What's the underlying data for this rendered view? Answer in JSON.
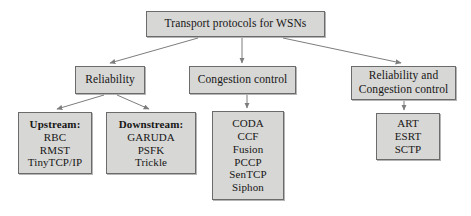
{
  "diagram": {
    "title": "Transport protocols for WSNs",
    "type": "hierarchy-tree",
    "nodes": {
      "root": {
        "id": "root",
        "lines": [
          "Transport protocols for WSNs"
        ]
      },
      "reliability": {
        "id": "reliability",
        "lines": [
          "Reliability"
        ]
      },
      "congestion": {
        "id": "congestion",
        "lines": [
          "Congestion control"
        ]
      },
      "rel_cong": {
        "id": "rel-cong",
        "lines": [
          "Reliability and",
          "Congestion control"
        ]
      },
      "upstream": {
        "id": "upstream",
        "heading": "Upstream:",
        "lines": [
          "RBC",
          "RMST",
          "TinyTCP/IP"
        ]
      },
      "downstream": {
        "id": "downstream",
        "heading": "Downstream:",
        "lines": [
          "GARUDA",
          "PSFK",
          "Trickle"
        ]
      },
      "congestion_list": {
        "id": "congestion-list",
        "lines": [
          "CODA",
          "CCF",
          "Fusion",
          "PCCP",
          "SenTCP",
          "Siphon"
        ]
      },
      "rel_cong_list": {
        "id": "rel-cong-list",
        "lines": [
          "ART",
          "ESRT",
          "SCTP"
        ]
      }
    },
    "colors": {
      "node_fill": "#d7d7d5",
      "node_border": "#6b6b6b",
      "connector": "#7d7d7d",
      "text": "#161616",
      "background": "#ffffff"
    },
    "edges": [
      {
        "from": "root",
        "to": "reliability"
      },
      {
        "from": "root",
        "to": "congestion"
      },
      {
        "from": "root",
        "to": "rel_cong"
      },
      {
        "from": "reliability",
        "to": "upstream"
      },
      {
        "from": "reliability",
        "to": "downstream"
      },
      {
        "from": "congestion",
        "to": "congestion_list"
      },
      {
        "from": "rel_cong",
        "to": "rel_cong_list"
      }
    ]
  }
}
